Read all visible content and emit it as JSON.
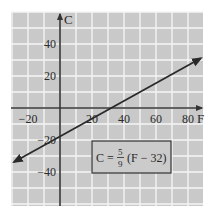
{
  "chart_data": {
    "type": "line",
    "title": "",
    "xlabel": "F",
    "ylabel": "C",
    "xlim": [
      -30,
      90
    ],
    "ylim": [
      -60,
      60
    ],
    "x_ticks": [
      -20,
      20,
      40,
      60,
      80
    ],
    "x_tick_labels": [
      "−20",
      "20",
      "40",
      "60",
      "80"
    ],
    "y_ticks": [
      40,
      20,
      -20,
      -40
    ],
    "y_tick_labels": [
      "40",
      "20",
      "−20",
      "−40"
    ],
    "grid": true,
    "grid_step": 10,
    "series": [
      {
        "name": "C = 5/9 (F − 32)",
        "x": [
          -28.75,
          0,
          32,
          88
        ],
        "y": [
          -33.75,
          -17.78,
          0,
          31.1
        ],
        "arrows": "both"
      }
    ],
    "annotation": {
      "lhs": "C =",
      "frac_num": "5",
      "frac_den": "9",
      "rhs": "(F − 32)"
    },
    "legend": null,
    "colors": {
      "background": "#c9c9c9",
      "grid": "#f4f4f4",
      "axis": "#333333",
      "line": "#2a2a2a"
    }
  }
}
